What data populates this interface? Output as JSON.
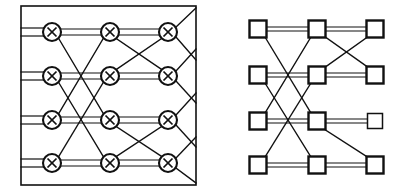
{
  "figure": {
    "background_color": "#ffffff",
    "line_color": "#111111",
    "width": 403,
    "height": 194
  },
  "diagrams": [
    {
      "id": "left-network",
      "name": "crossbar-switch-network",
      "node_glyph": "circle-with-x",
      "has_boundary_box": true,
      "boundary": {
        "x": 21,
        "y": 6,
        "width": 175,
        "height": 179
      },
      "columns_x": [
        52,
        110,
        168
      ],
      "rows_y": [
        32,
        76,
        120,
        163
      ],
      "node_radius": 9,
      "node_count": 12,
      "stage1_pattern": "distance-2 butterfly",
      "stage2_pattern": "distance-1 butterfly",
      "external_inputs": "double horizontal lines from left boundary into column 1",
      "external_outputs": "diagonal lines from column 3 to right boundary"
    },
    {
      "id": "right-network",
      "name": "square-node-network",
      "node_glyph": "square",
      "has_boundary_box": false,
      "columns_x": [
        258,
        317,
        375
      ],
      "rows_y": [
        29,
        75,
        121,
        165
      ],
      "node_size": 17,
      "node_count": 12,
      "stage1_pattern": "distance-2 butterfly",
      "stage2_pattern": "distance-1 butterfly, partial",
      "isolated_node": "column 3 row 3 drawn with thinner stroke"
    }
  ]
}
